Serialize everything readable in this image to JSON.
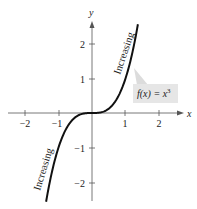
{
  "chart_data": {
    "type": "line",
    "title": "",
    "xlabel": "x",
    "ylabel": "y",
    "xlim": [
      -2.5,
      2.7
    ],
    "ylim": [
      -2.5,
      2.7
    ],
    "x_ticks": [
      -2,
      -1,
      1,
      2
    ],
    "y_ticks": [
      -2,
      -1,
      1,
      2
    ],
    "x_tick_labels": [
      "−2",
      "−1",
      "1",
      "2"
    ],
    "y_tick_labels": [
      "−2",
      "−1",
      "1",
      "2"
    ],
    "grid": false,
    "legend": null,
    "series": [
      {
        "name": "f(x) = x^3",
        "function": "x^3",
        "x": [
          -1.37,
          -1.2,
          -1.0,
          -0.8,
          -0.6,
          -0.4,
          -0.2,
          0,
          0.2,
          0.4,
          0.6,
          0.8,
          1.0,
          1.2,
          1.37
        ],
        "y": [
          -2.57,
          -1.728,
          -1.0,
          -0.512,
          -0.216,
          -0.064,
          -0.008,
          0,
          0.008,
          0.064,
          0.216,
          0.512,
          1.0,
          1.728,
          2.57
        ],
        "color": "#111111"
      }
    ],
    "annotations": [
      {
        "text": "Increasing",
        "position": "along curve, upper right (x≈0.9–1.2)",
        "rotation_deg": -72
      },
      {
        "text": "Increasing",
        "position": "along curve, lower left (x≈-1.3–-1.0)",
        "rotation_deg": -72
      },
      {
        "text": "f(x) = x³",
        "position": "callout box right of curve near (1.3, 0.8)"
      }
    ]
  },
  "labels": {
    "x_axis": "x",
    "y_axis": "y",
    "annotation_upper": "Increasing",
    "annotation_lower": "Increasing",
    "function_label_prefix": "f(x) = x",
    "function_label_exp": "3",
    "xticks": [
      "−2",
      "−1",
      "1",
      "2"
    ],
    "yticks": [
      "2",
      "1",
      "−1",
      "−2"
    ]
  },
  "colors": {
    "curve": "#111111",
    "axis": "#555555",
    "callout_box": "#e6e6e6",
    "callout_wedge": "#dcdcdc"
  }
}
